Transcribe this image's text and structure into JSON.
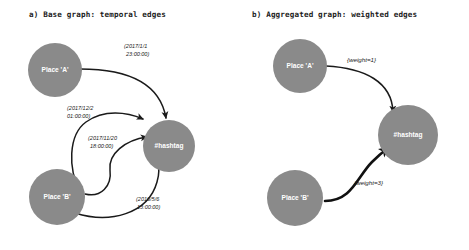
{
  "figure": {
    "background_color": "#ffffff",
    "node_color": "#8a8a8a",
    "node_label_color": "#ffffff",
    "edge_color": "#1a1a1a"
  },
  "panels": [
    {
      "id": "base-graph",
      "title": "a) Base graph: temporal edges",
      "nodes": [
        {
          "id": "place-a",
          "label": "Place 'A'"
        },
        {
          "id": "place-b",
          "label": "Place 'B'"
        },
        {
          "id": "hashtag",
          "label": "#hashtag"
        }
      ],
      "edges": [
        {
          "from": "place-a",
          "to": "hashtag",
          "label_line1": "(2017/1/1",
          "label_line2": "23:00:00)"
        },
        {
          "from": "place-b",
          "to": "hashtag",
          "label_line1": "(2017/12/2",
          "label_line2": "01:00:00)"
        },
        {
          "from": "place-b",
          "to": "hashtag",
          "label_line1": "(2017/11/20",
          "label_line2": "18:00:00)"
        },
        {
          "from": "place-b",
          "to": "hashtag",
          "label_line1": "(2016/5/6",
          "label_line2": "13:00:00)"
        }
      ]
    },
    {
      "id": "aggregated-graph",
      "title": "b) Aggregated graph: weighted edges",
      "nodes": [
        {
          "id": "place-a",
          "label": "Place 'A'"
        },
        {
          "id": "place-b",
          "label": "Place 'B'"
        },
        {
          "id": "hashtag",
          "label": "#hashtag"
        }
      ],
      "edges": [
        {
          "from": "place-a",
          "to": "hashtag",
          "label": "{weight=1}",
          "weight": 1
        },
        {
          "from": "place-b",
          "to": "hashtag",
          "label": "{weight=3}",
          "weight": 3
        }
      ]
    }
  ]
}
